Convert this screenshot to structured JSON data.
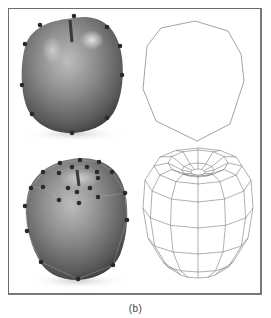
{
  "figure": {
    "caption": "(b)",
    "frame": {
      "x": 8,
      "y": 8,
      "width": 255,
      "height": 288,
      "stroke": "#6e6e6e"
    },
    "panels": [
      {
        "id": "top-left",
        "content": "photo of apple with silhouette control points",
        "apple": {
          "cx": 73,
          "cy": 76,
          "rx": 52,
          "ry": 60,
          "stem": {
            "x1": 70,
            "y1": 20,
            "x2": 72,
            "y2": 42
          }
        },
        "points": [
          [
            74,
            16
          ],
          [
            107,
            27
          ],
          [
            120,
            46
          ],
          [
            122,
            75
          ],
          [
            107,
            118
          ],
          [
            72,
            133
          ],
          [
            32,
            114
          ],
          [
            22,
            85
          ],
          [
            25,
            44
          ],
          [
            40,
            25
          ]
        ]
      },
      {
        "id": "top-right",
        "content": "2D polygon outline from control points",
        "polygon": [
          [
            195,
            21
          ],
          [
            228,
            31
          ],
          [
            241,
            54
          ],
          [
            244,
            81
          ],
          [
            230,
            124
          ],
          [
            197,
            141
          ],
          [
            156,
            121
          ],
          [
            143,
            89
          ],
          [
            147,
            46
          ],
          [
            161,
            28
          ]
        ],
        "stroke": "#888888"
      },
      {
        "id": "bottom-left",
        "content": "photo of apple with 3D mesh control points",
        "apple": {
          "cx": 77,
          "cy": 215,
          "rx": 52,
          "ry": 62
        },
        "points": [
          [
            80,
            160
          ],
          [
            60,
            163
          ],
          [
            99,
            162
          ],
          [
            43,
            172
          ],
          [
            72,
            167
          ],
          [
            87,
            167
          ],
          [
            59,
            173
          ],
          [
            97,
            172
          ],
          [
            112,
            172
          ],
          [
            31,
            188
          ],
          [
            43,
            187
          ],
          [
            68,
            188
          ],
          [
            77,
            192
          ],
          [
            90,
            188
          ],
          [
            98,
            178
          ],
          [
            125,
            193
          ],
          [
            59,
            200
          ],
          [
            79,
            203
          ],
          [
            98,
            197
          ],
          [
            25,
            206
          ],
          [
            127,
            220
          ],
          [
            27,
            231
          ],
          [
            41,
            262
          ],
          [
            113,
            265
          ],
          [
            78,
            279
          ]
        ]
      },
      {
        "id": "bottom-right",
        "content": "3D wireframe mesh of apple",
        "stroke": "#777777"
      }
    ],
    "colors": {
      "point": "#2a2a2a",
      "line": "#8a8a8a",
      "apple_dark": "#3c3c3c",
      "apple_mid": "#7a7a7a",
      "apple_light": "#d8d8d8"
    }
  }
}
